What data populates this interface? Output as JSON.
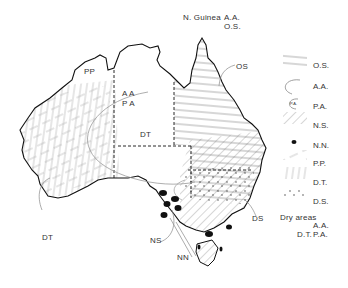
{
  "map": {
    "region": "Australia",
    "top_note": {
      "prefix": "N. Guinea",
      "line1": "A.A.",
      "line2": "O.S."
    },
    "region_labels": {
      "pp": "PP",
      "aa": "A A",
      "pa": "P A",
      "dt_center": "DT",
      "dt_southwest": "DT",
      "os": "OS",
      "ds": "DS",
      "ns": "NS",
      "nn": "NN"
    }
  },
  "legend": {
    "items": [
      {
        "code": "O.S.",
        "pattern": "horizontal-lines"
      },
      {
        "code": "A.A.",
        "pattern": "arc-boundary"
      },
      {
        "code": "P.A.",
        "pattern": "arc-boundary-labeled",
        "inner_label": "P.A."
      },
      {
        "code": "N.S.",
        "pattern": "diagonal-lines"
      },
      {
        "code": "N.N.",
        "pattern": "solid-black-blob"
      },
      {
        "code": "P.P.",
        "pattern": "dashed-diagonal"
      },
      {
        "code": "D.T.",
        "pattern": "vertical-lines"
      },
      {
        "code": "D.S.",
        "pattern": "dots"
      }
    ],
    "dry_areas": {
      "title": "Dry areas",
      "right_line1": "A.A.",
      "left_line2": "D.T.",
      "right_line2": "P.A."
    }
  }
}
